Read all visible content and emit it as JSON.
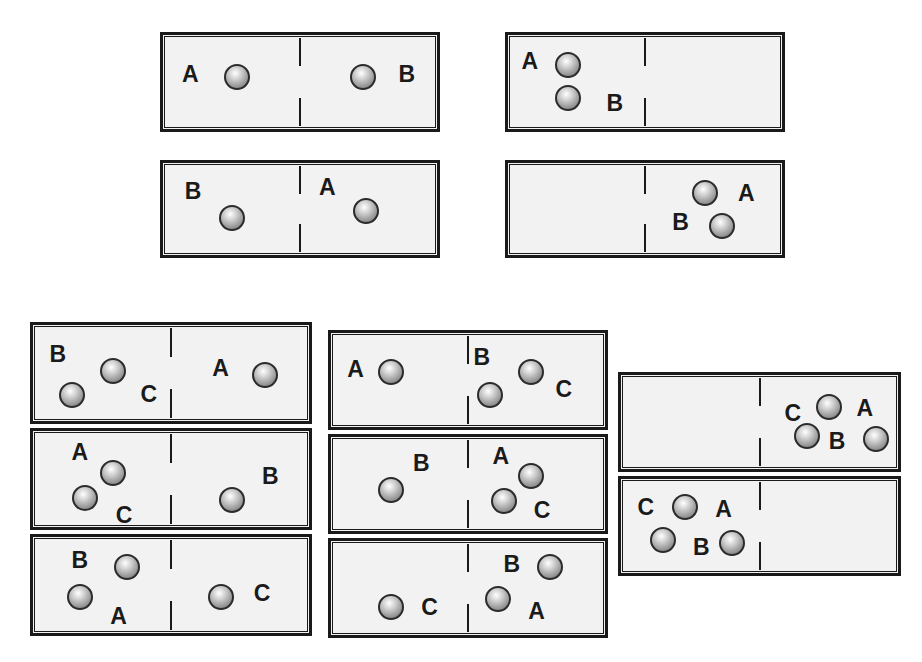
{
  "diagram": {
    "sphere_labels": [
      "A",
      "B",
      "C"
    ],
    "colors": {
      "background": "#ffffff",
      "box_fill": "#f2f2f2",
      "box_border": "#1a1a1a",
      "label_text": "#1a1a1a",
      "sphere_light": "#ffffff",
      "sphere_dark": "#6f6f6f",
      "sphere_outline": "#2b2b2b"
    },
    "groups": [
      {
        "id": "group-top-left-1",
        "x": 160,
        "y": 32,
        "width": 280,
        "height": 100,
        "boxes": [
          {
            "id": "box-1",
            "height": 100,
            "spheres": [
              {
                "label": "A",
                "cx": 27,
                "cy": 45,
                "lx": 10,
                "ly": 42
              },
              {
                "label": "B",
                "cx": 73,
                "cy": 45,
                "lx": 89,
                "ly": 42
              }
            ]
          }
        ]
      },
      {
        "id": "group-top-right-1",
        "x": 505,
        "y": 32,
        "width": 280,
        "height": 100,
        "boxes": [
          {
            "id": "box-2",
            "height": 100,
            "spheres": [
              {
                "label": "A",
                "cx": 22,
                "cy": 32,
                "lx": 8,
                "ly": 28
              },
              {
                "label": "B",
                "cx": 22,
                "cy": 67,
                "lx": 39,
                "ly": 72
              }
            ]
          }
        ]
      },
      {
        "id": "group-top-left-2",
        "x": 160,
        "y": 160,
        "width": 280,
        "height": 98,
        "boxes": [
          {
            "id": "box-3",
            "height": 98,
            "spheres": [
              {
                "label": "B",
                "cx": 25,
                "cy": 60,
                "lx": 11,
                "ly": 30
              },
              {
                "label": "A",
                "cx": 74,
                "cy": 52,
                "lx": 60,
                "ly": 26
              }
            ]
          }
        ]
      },
      {
        "id": "group-top-right-2",
        "x": 505,
        "y": 160,
        "width": 280,
        "height": 98,
        "boxes": [
          {
            "id": "box-4",
            "height": 98,
            "spheres": [
              {
                "label": "A",
                "cx": 72,
                "cy": 33,
                "lx": 87,
                "ly": 33
              },
              {
                "label": "B",
                "cx": 78,
                "cy": 69,
                "lx": 63,
                "ly": 64
              }
            ]
          }
        ]
      },
      {
        "id": "group-bottom-left",
        "x": 30,
        "y": 322,
        "width": 282,
        "height": 318,
        "boxes": [
          {
            "id": "box-5",
            "height": 102,
            "spheres": [
              {
                "label": "B",
                "cx": 14,
                "cy": 73,
                "lx": 9,
                "ly": 30
              },
              {
                "label": "C",
                "cx": 29,
                "cy": 48,
                "lx": 42,
                "ly": 72
              },
              {
                "label": "A",
                "cx": 84,
                "cy": 52,
                "lx": 68,
                "ly": 45
              }
            ]
          },
          {
            "id": "box-6",
            "height": 102,
            "spheres": [
              {
                "label": "A",
                "cx": 29,
                "cy": 44,
                "lx": 17,
                "ly": 22
              },
              {
                "label": "C",
                "cx": 19,
                "cy": 70,
                "lx": 33,
                "ly": 88
              },
              {
                "label": "B",
                "cx": 72,
                "cy": 72,
                "lx": 86,
                "ly": 47
              }
            ]
          },
          {
            "id": "box-7",
            "height": 102,
            "spheres": [
              {
                "label": "B",
                "cx": 34,
                "cy": 31,
                "lx": 17,
                "ly": 24
              },
              {
                "label": "A",
                "cx": 17,
                "cy": 62,
                "lx": 31,
                "ly": 82
              },
              {
                "label": "C",
                "cx": 68,
                "cy": 62,
                "lx": 83,
                "ly": 58
              }
            ]
          }
        ]
      },
      {
        "id": "group-bottom-middle",
        "x": 328,
        "y": 330,
        "width": 280,
        "height": 312,
        "boxes": [
          {
            "id": "box-8",
            "height": 100,
            "spheres": [
              {
                "label": "A",
                "cx": 22,
                "cy": 41,
                "lx": 9,
                "ly": 38
              },
              {
                "label": "B",
                "cx": 58,
                "cy": 66,
                "lx": 55,
                "ly": 25
              },
              {
                "label": "C",
                "cx": 73,
                "cy": 41,
                "lx": 85,
                "ly": 60
              }
            ]
          },
          {
            "id": "box-9",
            "height": 100,
            "spheres": [
              {
                "label": "B",
                "cx": 22,
                "cy": 56,
                "lx": 33,
                "ly": 28
              },
              {
                "label": "A",
                "cx": 73,
                "cy": 42,
                "lx": 62,
                "ly": 20
              },
              {
                "label": "C",
                "cx": 63,
                "cy": 68,
                "lx": 77,
                "ly": 78
              }
            ]
          },
          {
            "id": "box-10",
            "height": 100,
            "spheres": [
              {
                "label": "C",
                "cx": 22,
                "cy": 70,
                "lx": 36,
                "ly": 70
              },
              {
                "label": "B",
                "cx": 80,
                "cy": 28,
                "lx": 66,
                "ly": 24
              },
              {
                "label": "A",
                "cx": 61,
                "cy": 62,
                "lx": 75,
                "ly": 74
              }
            ]
          }
        ]
      },
      {
        "id": "group-bottom-right",
        "x": 618,
        "y": 372,
        "width": 283,
        "height": 212,
        "boxes": [
          {
            "id": "box-11",
            "height": 100,
            "spheres": [
              {
                "label": "C",
                "cx": 67,
                "cy": 65,
                "lx": 62,
                "ly": 40
              },
              {
                "label": "A",
                "cx": 75,
                "cy": 34,
                "lx": 88,
                "ly": 35
              },
              {
                "label": "B",
                "cx": 92,
                "cy": 68,
                "lx": 78,
                "ly": 70
              }
            ]
          },
          {
            "id": "box-12",
            "height": 100,
            "spheres": [
              {
                "label": "C",
                "cx": 23,
                "cy": 30,
                "lx": 9,
                "ly": 30
              },
              {
                "label": "A",
                "cx": 23,
                "cy": 30,
                "lx": 37,
                "ly": 32,
                "hide_sphere": true
              },
              {
                "label": "B",
                "cx": 15,
                "cy": 65,
                "lx": 29,
                "ly": 72
              },
              {
                "label": "",
                "cx": 40,
                "cy": 68,
                "lx": 0,
                "ly": 0,
                "no_label": true
              }
            ]
          }
        ]
      }
    ]
  }
}
